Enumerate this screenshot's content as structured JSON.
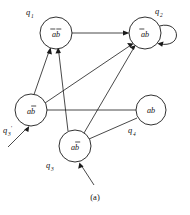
{
  "figure": {
    "caption": "(a)",
    "type": "state-transition-diagram",
    "stroke_color": "#1a1a1a",
    "background_color": "#ffffff"
  },
  "nodes": [
    {
      "id": "q1",
      "name": "q",
      "subscript": "1",
      "prime": "",
      "label_text": "ab",
      "overline": "both",
      "cx": 56,
      "cy": 33,
      "r": 16,
      "name_x": 26,
      "name_y": 15
    },
    {
      "id": "q2",
      "name": "q",
      "subscript": "2",
      "prime": "",
      "label_text": "ab",
      "overline": "first",
      "cx": 145,
      "cy": 33,
      "r": 16,
      "name_x": 155,
      "name_y": 14
    },
    {
      "id": "q3p",
      "name": "q",
      "subscript": "3",
      "prime": "'",
      "label_text": "ab",
      "overline": "second",
      "cx": 31,
      "cy": 110,
      "r": 16,
      "name_x": 3,
      "name_y": 133
    },
    {
      "id": "q3",
      "name": "q",
      "subscript": "3",
      "prime": "",
      "label_text": "ab",
      "overline": "second",
      "cx": 75,
      "cy": 146,
      "r": 16,
      "name_x": 46,
      "name_y": 168
    },
    {
      "id": "q4",
      "name": "q",
      "subscript": "4",
      "prime": "",
      "label_text": "ab",
      "overline": "none",
      "cx": 151,
      "cy": 110,
      "r": 15,
      "name_x": 128,
      "name_y": 133
    }
  ],
  "edges": [
    {
      "id": "q1-to-q2",
      "from": "q1",
      "to": "q2",
      "arrow": "end"
    },
    {
      "id": "q3p-to-q1",
      "from": "q3p",
      "to": "q1",
      "arrow": "end"
    },
    {
      "id": "q3-to-q1",
      "from": "q3",
      "to": "q1",
      "arrow": "end"
    },
    {
      "id": "q3p-to-q2",
      "from": "q3p",
      "to": "q2",
      "arrow": "end"
    },
    {
      "id": "q3-to-q2",
      "from": "q3",
      "to": "q2",
      "arrow": "end"
    },
    {
      "id": "q3p-to-q4",
      "from": "q3p",
      "to": "q4",
      "arrow": "none"
    },
    {
      "id": "q4-to-q3",
      "from": "q4",
      "to": "q3",
      "arrow": "none"
    },
    {
      "id": "q2-self",
      "from": "q2",
      "to": "q2",
      "arrow": "end"
    },
    {
      "id": "start-q3p",
      "from": "start",
      "to": "q3p",
      "arrow": "end"
    },
    {
      "id": "start-q3",
      "from": "start",
      "to": "q3",
      "arrow": "end"
    }
  ]
}
